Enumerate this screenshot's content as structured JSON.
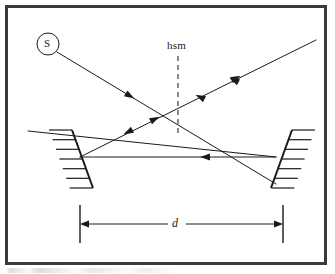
{
  "figure": {
    "kind": "optical-ray-diagram",
    "width": 335,
    "height": 274,
    "background_color": "#ffffff",
    "ink_color": "#1a1a1a",
    "dashed_color": "#8a8a8a"
  },
  "frame": {
    "name": "figure-border",
    "x": 5,
    "y": 5,
    "width": 322,
    "height": 260,
    "stroke": "#3a3a3a",
    "stroke_width": 3
  },
  "labels": {
    "source": "S",
    "half_silvered_mirror": "hsm",
    "separation": "d"
  },
  "source_marker": {
    "name": "source-circle",
    "cx": 48,
    "cy": 44,
    "r": 11,
    "stroke": "#1a1a1a",
    "stroke_width": 1
  },
  "hsm_plane": {
    "name": "hsm-dashed-line",
    "x": 178,
    "y_top": 56,
    "y_bottom": 136,
    "dash": "5,4",
    "stroke": "#8a8a8a",
    "stroke_width": 2
  },
  "mirrors": [
    {
      "name": "left-mirror",
      "x1": 72,
      "y1": 130,
      "x2": 93,
      "y2": 188,
      "hatch_side": "left",
      "hatch_count": 6,
      "hatch_length": 23
    },
    {
      "name": "right-mirror",
      "x1": 292,
      "y1": 130,
      "x2": 271,
      "y2": 188,
      "hatch_side": "right",
      "hatch_count": 6,
      "hatch_length": 23
    }
  ],
  "rays": [
    {
      "name": "ray-source-to-right-mirror",
      "points": [
        [
          57,
          52
        ],
        [
          276,
          184
        ]
      ],
      "arrow_at": 0.33,
      "arrow_dir": "down-right"
    },
    {
      "name": "ray-incoming-upper-right",
      "points": [
        [
          316,
          40
        ],
        [
          80,
          157
        ]
      ],
      "arrow_at": 0.36,
      "arrow_dir": "down-left"
    },
    {
      "name": "ray-left-mirror-up-right",
      "points": [
        [
          80,
          157
        ],
        [
          316,
          40
        ]
      ],
      "arrow_at": 0.3,
      "arrow_dir": "up-right"
    },
    {
      "name": "ray-horizontal-right-to-left",
      "points": [
        [
          276,
          157
        ],
        [
          80,
          157
        ]
      ],
      "arrow_at": 0.36,
      "arrow_dir": "left"
    },
    {
      "name": "ray-upper-left-entry",
      "points": [
        [
          28,
          131
        ],
        [
          276,
          157
        ]
      ],
      "arrow_at": null,
      "arrow_dir": null
    }
  ],
  "dimension": {
    "name": "separation-dimension",
    "y": 224,
    "x_left": 80,
    "x_right": 283,
    "tick_top": 205,
    "tick_bottom": 243,
    "label": "d",
    "stroke": "#1a1a1a"
  }
}
